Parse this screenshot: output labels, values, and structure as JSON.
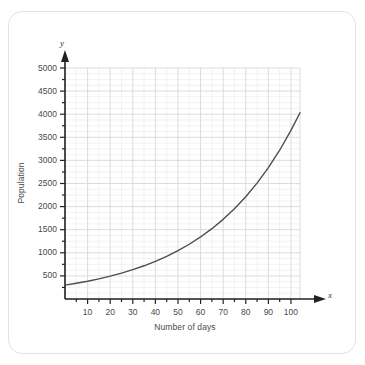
{
  "chart_data": {
    "type": "line",
    "title": "",
    "xlabel": "Number of days",
    "ylabel": "Population",
    "x_axis_name": "x",
    "y_axis_name": "y",
    "xlim": [
      0,
      104
    ],
    "ylim": [
      0,
      5000
    ],
    "grid": true,
    "legend": "none",
    "x_major_ticks": [
      10,
      20,
      30,
      40,
      50,
      60,
      70,
      80,
      90,
      100
    ],
    "x_minor_step": 5,
    "y_major_ticks": [
      500,
      1000,
      1500,
      2000,
      2500,
      3000,
      3500,
      4000,
      4500,
      5000
    ],
    "y_minor_step": 250,
    "grid_x_step": 5,
    "grid_y_step": 125,
    "grid_major_x_step": 10,
    "grid_major_y_step": 500,
    "curve_color": "#4d4d4d",
    "grid_color": "#d8d8d8",
    "grid_minor_color": "#ececec",
    "axis_color": "#222222",
    "series": [
      {
        "name": "Population",
        "x": [
          0,
          5,
          10,
          15,
          20,
          25,
          30,
          35,
          40,
          45,
          50,
          55,
          60,
          65,
          70,
          75,
          80,
          85,
          90,
          95,
          100,
          104
        ],
        "values": [
          300,
          340,
          385,
          436,
          494,
          560,
          635,
          719,
          815,
          923,
          1046,
          1185,
          1343,
          1522,
          1724,
          1954,
          2214,
          2508,
          2842,
          3220,
          3649,
          4032
        ]
      }
    ]
  },
  "axes": {
    "x_ticks": [
      "10",
      "20",
      "30",
      "40",
      "50",
      "60",
      "70",
      "80",
      "90",
      "100"
    ],
    "y_ticks": [
      "5000",
      "4500",
      "4000",
      "3500",
      "3000",
      "2500",
      "2000",
      "1500",
      "1000",
      "500"
    ]
  },
  "labels": {
    "x_title": "Number of days",
    "y_title": "Population",
    "x_axis_letter": "x",
    "y_axis_letter": "y"
  }
}
